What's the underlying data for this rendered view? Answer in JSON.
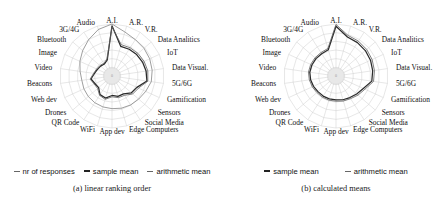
{
  "figure": {
    "panels": [
      {
        "id": "panel-a",
        "caption": "(a) linear ranking order",
        "legend": [
          {
            "label": "nr of responses",
            "style": "thin"
          },
          {
            "label": "sample mean",
            "style": "thick"
          },
          {
            "label": "arithmetic mean",
            "style": "thin"
          }
        ]
      },
      {
        "id": "panel-b",
        "caption": "(b) calculated means",
        "legend": [
          {
            "label": "sample mean",
            "style": "thick"
          },
          {
            "label": "arithmetic mean",
            "style": "thin"
          }
        ]
      }
    ],
    "center_tick": "0"
  },
  "chart_data": [
    {
      "type": "radar",
      "title": "(a) linear ranking order",
      "grid": true,
      "rings": 6,
      "legend_position": "bottom",
      "start_angle_deg": -90,
      "direction": "clockwise",
      "rlim": [
        0,
        1
      ],
      "categories": [
        "A.I.",
        "A.R.",
        "V.R.",
        "Data Analitics",
        "IoT",
        "Data Visual.",
        "5G/6G",
        "Gamification",
        "Sensors",
        "Social Media",
        "Edge Computers",
        "App dev",
        "WiFi",
        "QR Code",
        "Drones",
        "Web dev",
        "Beacons",
        "Video",
        "Image",
        "Bluetooth",
        "3G/4G",
        "Audio"
      ],
      "series": [
        {
          "name": "nr of responses",
          "values": [
            1.0,
            0.86,
            0.8,
            0.78,
            0.76,
            0.74,
            0.72,
            0.66,
            0.62,
            0.6,
            0.58,
            0.56,
            0.55,
            0.54,
            0.53,
            0.52,
            0.51,
            0.55,
            0.62,
            0.7,
            0.8,
            0.92
          ]
        },
        {
          "name": "sample mean",
          "values": [
            0.96,
            0.52,
            0.54,
            0.56,
            0.58,
            0.6,
            0.62,
            0.44,
            0.4,
            0.3,
            0.3,
            0.26,
            0.34,
            0.32,
            0.22,
            0.24,
            0.3,
            0.22,
            0.18,
            0.16,
            0.14,
            0.2
          ]
        },
        {
          "name": "arithmetic mean",
          "values": [
            0.94,
            0.56,
            0.58,
            0.6,
            0.62,
            0.64,
            0.64,
            0.48,
            0.44,
            0.34,
            0.33,
            0.29,
            0.37,
            0.34,
            0.25,
            0.26,
            0.32,
            0.24,
            0.2,
            0.18,
            0.16,
            0.22
          ]
        }
      ]
    },
    {
      "type": "radar",
      "title": "(b) calculated means",
      "grid": true,
      "rings": 6,
      "legend_position": "bottom",
      "start_angle_deg": -90,
      "direction": "clockwise",
      "rlim": [
        0,
        1
      ],
      "categories": [
        "A.I.",
        "A.R.",
        "V.R.",
        "Data Analitics",
        "IoT",
        "Data Visual.",
        "5G/6G",
        "Gamification",
        "Sensors",
        "Social Media",
        "Edge Computers",
        "App dev",
        "WiFi",
        "QR Code",
        "Drones",
        "Web dev",
        "Beacons",
        "Video",
        "Image",
        "Bluetooth",
        "3G/4G",
        "Audio"
      ],
      "series": [
        {
          "name": "sample mean",
          "values": [
            0.95,
            0.74,
            0.72,
            0.7,
            0.68,
            0.66,
            0.64,
            0.5,
            0.44,
            0.4,
            0.38,
            0.36,
            0.36,
            0.36,
            0.36,
            0.38,
            0.4,
            0.42,
            0.42,
            0.42,
            0.42,
            0.44
          ]
        },
        {
          "name": "arithmetic mean",
          "values": [
            0.99,
            0.78,
            0.76,
            0.74,
            0.72,
            0.7,
            0.68,
            0.54,
            0.48,
            0.43,
            0.41,
            0.39,
            0.39,
            0.39,
            0.39,
            0.41,
            0.43,
            0.45,
            0.45,
            0.45,
            0.45,
            0.47
          ]
        }
      ]
    }
  ]
}
